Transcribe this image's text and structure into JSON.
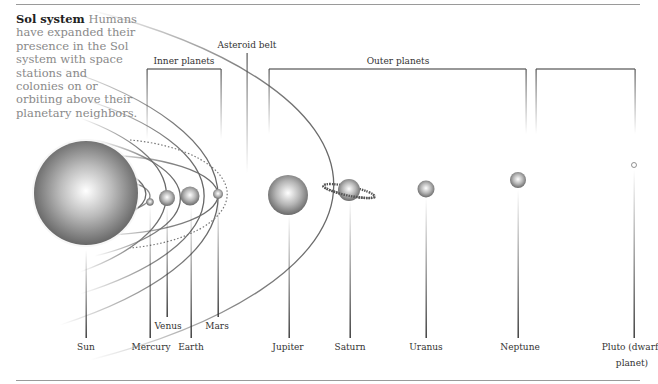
{
  "intro": {
    "title": "Sol system",
    "body": "Humans have expanded their presence in the Sol system with space stations and colonies on or orbiting above their planetary neighbors."
  },
  "groups": {
    "inner": "Inner planets",
    "asteroid": "Asteroid belt",
    "outer": "Outer planets"
  },
  "bodies": [
    {
      "name": "Sun",
      "label": "Sun"
    },
    {
      "name": "Mercury",
      "label": "Mercury"
    },
    {
      "name": "Venus",
      "label": "Venus"
    },
    {
      "name": "Earth",
      "label": "Earth"
    },
    {
      "name": "Mars",
      "label": "Mars"
    },
    {
      "name": "Jupiter",
      "label": "Jupiter"
    },
    {
      "name": "Saturn",
      "label": "Saturn"
    },
    {
      "name": "Uranus",
      "label": "Uranus"
    },
    {
      "name": "Neptune",
      "label": "Neptune"
    },
    {
      "name": "Pluto",
      "label": "Pluto (dwarf",
      "label2": "planet)"
    }
  ]
}
